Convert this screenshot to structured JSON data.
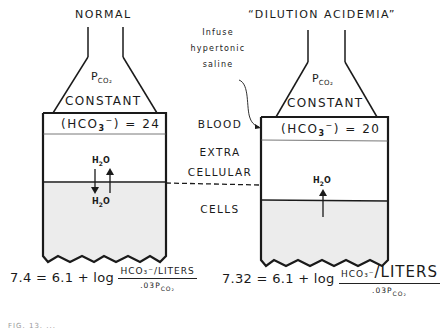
{
  "left_panel": {
    "title": "NORMAL",
    "gas_label": "P",
    "gas_sub": "CO₂",
    "constant_label": "CONSTANT",
    "bicarb_label": "(HCO",
    "bicarb_sub": "3",
    "bicarb_sup": "−",
    "bicarb_value": ") = 24",
    "h2o_top": "H",
    "h2o_bottom": "H",
    "h2o_sub": "2",
    "h2o_o": "O",
    "arrows": [
      "down",
      "up"
    ],
    "equation": {
      "lhs": "7.4 = 6.1 + log",
      "numerator": "HCO₃⁻/LITERS",
      "denominator_prefix": ".03P",
      "denominator_sub": "CO₂"
    }
  },
  "right_panel": {
    "title": "“DILUTION ACIDEMIA”",
    "gas_label": "P",
    "gas_sub": "CO₂",
    "constant_label": "CONSTANT",
    "bicarb_label": "(HCO",
    "bicarb_sub": "3",
    "bicarb_sup": "−",
    "bicarb_value": ") = 20",
    "h2o_label": "H",
    "h2o_sub": "2",
    "h2o_o": "O",
    "arrows": [
      "up"
    ],
    "equation": {
      "lhs": "7.32 = 6.1 + log",
      "numerator_small": "HCO₃⁻",
      "numerator_big": "/LITERS",
      "denominator_prefix": ".03P",
      "denominator_sub": "CO₂"
    }
  },
  "middle_labels": {
    "annotation_lines": [
      "Infuse",
      "hypertonic",
      "saline"
    ],
    "blood": "BLOOD",
    "extracellular_1": "EXTRA",
    "extracellular_2": "CELLULAR",
    "cells": "CELLS"
  },
  "caption": "FIG. 13. ...",
  "colors": {
    "ink": "#1a1a1a",
    "cells_fill": "#ececec",
    "background": "#ffffff"
  }
}
